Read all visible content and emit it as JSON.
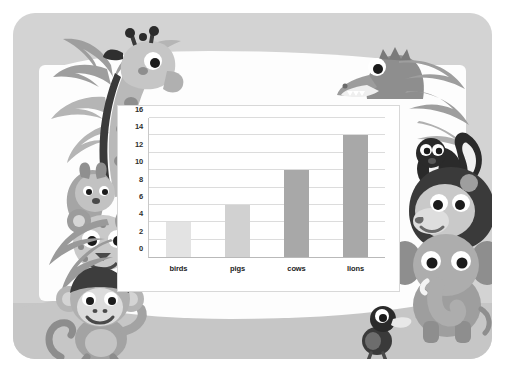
{
  "poster": {
    "card_background": "#d3d3d3",
    "sheet_background": "#fdfdfd",
    "ground_color": "#c6c6c6",
    "decorations": [
      {
        "name": "giraffe",
        "label": "giraffe"
      },
      {
        "name": "palm-leaves-top-left",
        "label": "palm leaves"
      },
      {
        "name": "squirrel",
        "label": "squirrel"
      },
      {
        "name": "leopard",
        "label": "leopard"
      },
      {
        "name": "monkey",
        "label": "monkey"
      },
      {
        "name": "crocodile",
        "label": "crocodile"
      },
      {
        "name": "palm-leaves-top-right",
        "label": "palm leaves"
      },
      {
        "name": "skunk",
        "label": "skunk"
      },
      {
        "name": "lion",
        "label": "lion"
      },
      {
        "name": "elephant",
        "label": "elephant"
      },
      {
        "name": "duck",
        "label": "duck"
      }
    ]
  },
  "chart_data": {
    "type": "bar",
    "title": "",
    "subtitle": "",
    "xlabel": "",
    "ylabel": "",
    "categories": [
      "birds",
      "pigs",
      "cows",
      "lions"
    ],
    "values": [
      4,
      6,
      10,
      14
    ],
    "bar_colors": [
      "#e3e3e3",
      "#d1d1d1",
      "#a8a8a8",
      "#a8a8a8"
    ],
    "ylim": [
      0,
      16
    ],
    "ytick_step": 2,
    "yticks": [
      0,
      2,
      4,
      6,
      8,
      10,
      12,
      14,
      16
    ],
    "ytick_labels": [
      "0",
      "2",
      "4",
      "6",
      "8",
      "10",
      "12",
      "14",
      "16"
    ],
    "grid": true,
    "grid_color": "#dcdcdc",
    "legend": false,
    "legend_position": "none",
    "plot_background": "#ffffff",
    "frame_border_color": "#d8d8d8",
    "axis_color": "#b9b9b9"
  }
}
